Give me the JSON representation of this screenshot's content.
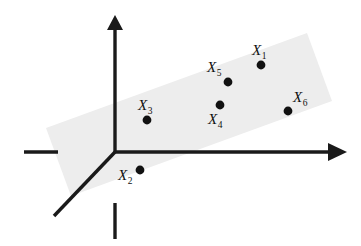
{
  "figure": {
    "background_color": "#ffffff",
    "width": 361,
    "height": 246
  },
  "plane": {
    "name": "shaded-plane",
    "fill_color": "#ededed",
    "description": "Tilted rectangular plane (parallelogram in projection) spanning the first octant region",
    "corners": [
      {
        "x": 46,
        "y": 128
      },
      {
        "x": 307,
        "y": 33
      },
      {
        "x": 332,
        "y": 101
      },
      {
        "x": 71,
        "y": 196
      }
    ]
  },
  "axes": {
    "stroke_color": "#1a1a1a",
    "stroke_width": 3.4,
    "origin": {
      "x": 115,
      "y": 152
    },
    "items": [
      {
        "name": "vertical-axis",
        "label": "",
        "from": {
          "x": 115,
          "y": 152
        },
        "to": {
          "x": 115,
          "y": 28
        },
        "has_arrow": true,
        "arrow": {
          "tip": {
            "x": 115,
            "y": 15
          },
          "left": {
            "x": 107,
            "y": 30
          },
          "right": {
            "x": 123,
            "y": 30
          }
        }
      },
      {
        "name": "vertical-axis-negative-stub",
        "label": "",
        "from": {
          "x": 115,
          "y": 203
        },
        "to": {
          "x": 115,
          "y": 239
        },
        "has_arrow": false
      },
      {
        "name": "horizontal-axis",
        "label": "",
        "from": {
          "x": 115,
          "y": 152
        },
        "to": {
          "x": 330,
          "y": 152
        },
        "has_arrow": true,
        "arrow": {
          "tip": {
            "x": 347,
            "y": 152
          },
          "left": {
            "x": 328,
            "y": 143
          },
          "right": {
            "x": 328,
            "y": 161
          }
        }
      },
      {
        "name": "horizontal-axis-negative-stub",
        "label": "",
        "from": {
          "x": 24,
          "y": 152
        },
        "to": {
          "x": 58,
          "y": 152
        },
        "has_arrow": false
      },
      {
        "name": "depth-axis",
        "label": "",
        "from": {
          "x": 115,
          "y": 152
        },
        "to": {
          "x": 54,
          "y": 216
        },
        "has_arrow": false
      }
    ]
  },
  "points": [
    {
      "id": "X1",
      "label_base": "X",
      "label_sub": "1",
      "point": {
        "x": 261,
        "y": 65
      },
      "label_pos": {
        "x": 252,
        "y": 55
      },
      "radius": 4.4
    },
    {
      "id": "X2",
      "label_base": "X",
      "label_sub": "2",
      "point": {
        "x": 140,
        "y": 170
      },
      "label_pos": {
        "x": 118,
        "y": 180
      },
      "radius": 4.4
    },
    {
      "id": "X3",
      "label_base": "X",
      "label_sub": "3",
      "point": {
        "x": 147,
        "y": 120
      },
      "label_pos": {
        "x": 138,
        "y": 110
      },
      "radius": 4.4
    },
    {
      "id": "X4",
      "label_base": "X",
      "label_sub": "4",
      "point": {
        "x": 220,
        "y": 105
      },
      "label_pos": {
        "x": 208,
        "y": 124
      },
      "radius": 4.4
    },
    {
      "id": "X5",
      "label_base": "X",
      "label_sub": "5",
      "point": {
        "x": 228,
        "y": 82
      },
      "label_pos": {
        "x": 207,
        "y": 72
      },
      "radius": 4.4
    },
    {
      "id": "X6",
      "label_base": "X",
      "label_sub": "6",
      "point": {
        "x": 288,
        "y": 111
      },
      "label_pos": {
        "x": 293,
        "y": 102
      },
      "radius": 4.4
    }
  ]
}
